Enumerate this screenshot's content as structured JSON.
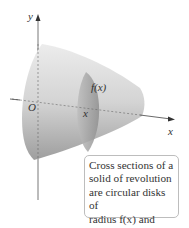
{
  "figure": {
    "axis_labels": {
      "y": "y",
      "x": "x",
      "origin": "O"
    },
    "annotations": {
      "radius": "f(x)",
      "position": "x"
    },
    "caption": {
      "lines": [
        "Cross sections of a",
        "solid of revolution",
        "are circular disks of",
        "radius f(x) and area",
        "πf(x)²."
      ]
    }
  },
  "colors": {
    "solid_light": "#e6e6e6",
    "solid_dark": "#a9a9a9",
    "disk": "#b0b0b0",
    "axis": "#444444",
    "caption_border": "#bdbdbd"
  }
}
